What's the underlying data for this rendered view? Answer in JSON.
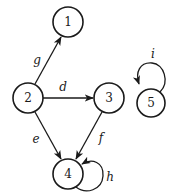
{
  "diagram": {
    "type": "directed-graph",
    "nodes": [
      {
        "id": "1",
        "label": "1",
        "x": 68,
        "y": 22
      },
      {
        "id": "2",
        "label": "2",
        "x": 28,
        "y": 98
      },
      {
        "id": "3",
        "label": "3",
        "x": 109,
        "y": 98
      },
      {
        "id": "4",
        "label": "4",
        "x": 68,
        "y": 174
      },
      {
        "id": "5",
        "label": "5",
        "x": 151,
        "y": 103
      }
    ],
    "edges": [
      {
        "id": "g",
        "label": "g",
        "from": "2",
        "to": "1"
      },
      {
        "id": "d",
        "label": "d",
        "from": "2",
        "to": "3"
      },
      {
        "id": "e",
        "label": "e",
        "from": "2",
        "to": "4"
      },
      {
        "id": "f",
        "label": "f",
        "from": "3",
        "to": "4"
      },
      {
        "id": "h",
        "label": "h",
        "from": "4",
        "to": "4",
        "self_loop": true
      },
      {
        "id": "i",
        "label": "i",
        "from": "5",
        "to": "5",
        "self_loop": true
      }
    ]
  }
}
